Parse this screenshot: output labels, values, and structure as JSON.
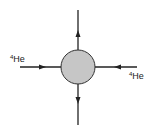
{
  "diagram": {
    "type": "interaction-vertex",
    "vertex": {
      "shape": "circle",
      "fill": "#c6c6c6",
      "stroke": "#333333"
    },
    "lines": [
      {
        "id": "left",
        "direction": "incoming",
        "arrow": "right"
      },
      {
        "id": "right",
        "direction": "incoming",
        "arrow": "left"
      },
      {
        "id": "top",
        "direction": "outgoing",
        "arrow": "up"
      },
      {
        "id": "bottom",
        "direction": "outgoing",
        "arrow": "down"
      }
    ],
    "labels": {
      "left": {
        "mass_number": "4",
        "symbol": "He"
      },
      "right": {
        "mass_number": "4",
        "symbol": "He"
      }
    },
    "line_color": "#222222"
  }
}
